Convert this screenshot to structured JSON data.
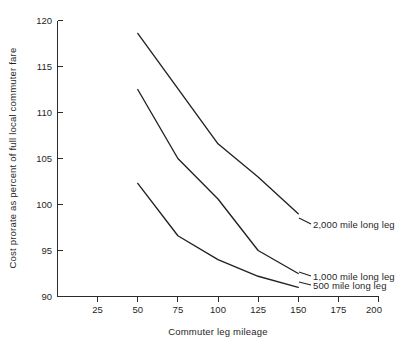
{
  "chart_data": {
    "type": "line",
    "title": "",
    "xlabel": "Commuter leg mileage",
    "ylabel": "Cost prorate as percent of full local commuter fare",
    "xlim": [
      0,
      200
    ],
    "ylim": [
      90,
      120
    ],
    "xticks": [
      25,
      50,
      75,
      100,
      125,
      150,
      175,
      200
    ],
    "yticks": [
      90,
      95,
      100,
      105,
      110,
      115,
      120
    ],
    "grid": false,
    "legend_position": "inline-right-of-curve-ends",
    "x": [
      50,
      75,
      100,
      125,
      150
    ],
    "series": [
      {
        "name": "2,000 mile long leg",
        "values": [
          118.6,
          112.6,
          106.6,
          103.0,
          99.0
        ]
      },
      {
        "name": "1,000 mile long leg",
        "values": [
          112.5,
          105.0,
          100.6,
          95.0,
          92.5
        ]
      },
      {
        "name": "500 mile long leg",
        "values": [
          102.3,
          96.6,
          94.0,
          92.2,
          91.0
        ]
      }
    ],
    "annotations": [
      "2,000 mile long leg",
      "1,000 mile long leg",
      "500 mile long leg"
    ]
  },
  "axis": {
    "y_tick_labels": [
      "120",
      "115",
      "110",
      "105",
      "100",
      "95",
      "90"
    ],
    "x_tick_labels": [
      "25",
      "50",
      "75",
      "100",
      "125",
      "150",
      "175",
      "200"
    ],
    "x_title": "Commuter leg mileage",
    "y_title": "Cost prorate as percent of full local commuter fare"
  },
  "series_labels": {
    "s2000": "2,000 mile long leg",
    "s1000": "1,000 mile long leg",
    "s500": "500 mile long leg"
  },
  "caption": {
    "text": ""
  },
  "colors": {
    "ink": "#23211f",
    "paper": "#ffffff",
    "axis": "#2b2b2b"
  }
}
